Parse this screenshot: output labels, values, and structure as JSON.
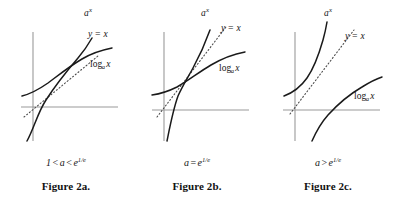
{
  "document": {
    "type": "mathematical-figure",
    "background_color": "#ffffff",
    "axis_color": "#9a9a9a",
    "curve_color": "#1a1a1a",
    "dotted_line_color": "#4d4d4d"
  },
  "figures": [
    {
      "id": "figure-2a",
      "caption": "Figure 2a.",
      "condition": {
        "full": "1 < a < e^(1/e)",
        "lhs": "1",
        "relation_1": "<",
        "base": "a",
        "relation_2": "<",
        "rhs_base": "e",
        "rhs_exponent": "1/e"
      },
      "labels": {
        "exponential": "a",
        "exponential_exponent": "x",
        "identity": "y = x",
        "logarithm_head": "log",
        "logarithm_base": "a",
        "logarithm_arg": "x"
      },
      "description": "Exponential a^x and log_a x each cross the line y = x at two points, forming a lens-shaped region."
    },
    {
      "id": "figure-2b",
      "caption": "Figure 2b.",
      "condition": {
        "full": "a = e^(1/e)",
        "base": "a",
        "relation_1": "=",
        "rhs_base": "e",
        "rhs_exponent": "1/e"
      },
      "labels": {
        "exponential": "a",
        "exponential_exponent": "x",
        "identity": "y = x",
        "logarithm_head": "log",
        "logarithm_base": "a",
        "logarithm_arg": "x"
      },
      "description": "Exponential a^x and log_a x are tangent to the line y = x at a single point."
    },
    {
      "id": "figure-2c",
      "caption": "Figure 2c.",
      "condition": {
        "full": "a > e^(1/e)",
        "base": "a",
        "relation_1": ">",
        "rhs_base": "e",
        "rhs_exponent": "1/e"
      },
      "labels": {
        "exponential": "a",
        "exponential_exponent": "x",
        "identity": "y = x",
        "logarithm_head": "log",
        "logarithm_base": "a",
        "logarithm_arg": "x"
      },
      "description": "Exponential a^x lies entirely above and log_a x entirely below the line y = x; no intersection."
    }
  ]
}
